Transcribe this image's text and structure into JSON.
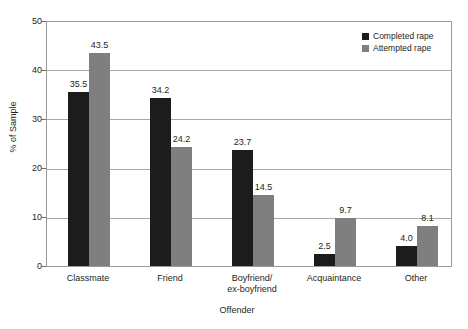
{
  "chart_data": {
    "type": "bar",
    "title": "",
    "xlabel": "Offender",
    "ylabel": "% of Sample",
    "ylim": [
      0,
      50
    ],
    "ytick_labels": [
      "0",
      "10",
      "20",
      "30",
      "40",
      "50"
    ],
    "ytick_values": [
      0,
      10,
      20,
      30,
      40,
      50
    ],
    "grid": true,
    "legend_position": "top-right",
    "categories": [
      "Classmate",
      "Friend",
      "Boyfriend/\nex-boyfriend",
      "Acquaintance",
      "Other"
    ],
    "category_lines": [
      [
        "Classmate"
      ],
      [
        "Friend"
      ],
      [
        "Boyfriend/",
        "ex-boyfriend"
      ],
      [
        "Acquaintance"
      ],
      [
        "Other"
      ]
    ],
    "series": [
      {
        "name": "Completed rape",
        "color": "#1c1c1c",
        "values": [
          35.5,
          34.2,
          23.7,
          2.5,
          4.0
        ],
        "labels": [
          "35.5",
          "34.2",
          "23.7",
          "2.5",
          "4.0"
        ]
      },
      {
        "name": "Attempted rape",
        "color": "#7f7f7f",
        "values": [
          43.5,
          24.2,
          14.5,
          9.7,
          8.1
        ],
        "labels": [
          "43.5",
          "24.2",
          "14.5",
          "9.7",
          "8.1"
        ]
      }
    ]
  },
  "legend": {
    "items": [
      {
        "label": "Completed rape",
        "color": "#1c1c1c"
      },
      {
        "label": "Attempted rape",
        "color": "#7f7f7f"
      }
    ]
  },
  "axis": {
    "y_title": "% of Sample",
    "x_title": "Offender",
    "y_ticks": [
      "50",
      "40",
      "30",
      "20",
      "10",
      "0"
    ]
  }
}
